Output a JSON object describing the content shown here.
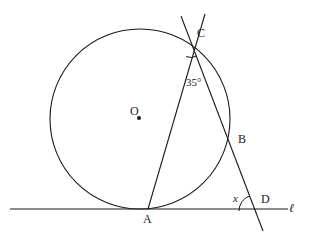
{
  "figure": {
    "type": "circle-geometry-diagram",
    "width": 309,
    "height": 237,
    "background_color": "#ffffff",
    "stroke_color": "#1a1a1a"
  },
  "labels": {
    "center": "O",
    "point_a": "A",
    "point_b": "B",
    "point_c": "C",
    "point_d": "D",
    "line_l": "ℓ",
    "angle_at_c": "35°",
    "angle_at_d": "x"
  },
  "geometry": {
    "circle": {
      "cx": 140,
      "cy": 119,
      "r": 90
    },
    "center_dot": {
      "cx": 139,
      "cy": 118,
      "r": 2
    },
    "points": {
      "A": {
        "x": 148,
        "y": 209
      },
      "B": {
        "x": 233,
        "y": 140
      },
      "C": {
        "x": 192,
        "y": 43
      },
      "D": {
        "x": 255,
        "y": 211
      }
    },
    "lines": [
      {
        "name": "tangent-line-l",
        "x1": 10,
        "y1": 209,
        "x2": 288,
        "y2": 209
      },
      {
        "name": "chord-ac-extended",
        "x1": 148,
        "y1": 209,
        "x2": 205,
        "y2": 14
      },
      {
        "name": "secant-cbd-extended",
        "x1": 181,
        "y1": 16,
        "x2": 263,
        "y2": 231
      }
    ],
    "angle_arcs": [
      {
        "name": "angle-arc-at-c",
        "cx": 192,
        "cy": 43,
        "r": 14
      },
      {
        "name": "angle-arc-at-d",
        "cx": 255,
        "cy": 211,
        "r": 16
      }
    ]
  },
  "label_positions": {
    "center": {
      "x": 130,
      "y": 105
    },
    "point_a": {
      "x": 143,
      "y": 213
    },
    "point_b": {
      "x": 238,
      "y": 133
    },
    "point_c": {
      "x": 197,
      "y": 27
    },
    "point_d": {
      "x": 261,
      "y": 193
    },
    "line_l": {
      "x": 289,
      "y": 202
    },
    "angle_at_c": {
      "x": 186,
      "y": 77
    },
    "angle_at_d": {
      "x": 233,
      "y": 193
    }
  }
}
